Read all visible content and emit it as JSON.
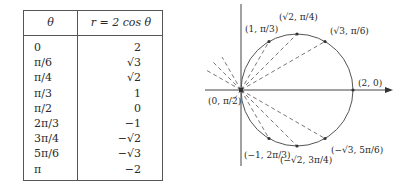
{
  "table": {
    "headers": {
      "theta": "θ",
      "r": "r = 2 cos θ"
    },
    "rows": [
      {
        "theta": "0",
        "r": "2"
      },
      {
        "theta": "π/6",
        "r": "√3"
      },
      {
        "theta": "π/4",
        "r": "√2"
      },
      {
        "theta": "π/3",
        "r": "1"
      },
      {
        "theta": "π/2",
        "r": "0"
      },
      {
        "theta": "2π/3",
        "r": "−1"
      },
      {
        "theta": "3π/4",
        "r": "−√2"
      },
      {
        "theta": "5π/6",
        "r": "−√3"
      },
      {
        "theta": "π",
        "r": "−2"
      }
    ]
  },
  "graph": {
    "curve": "r = 2 cos θ (circle)",
    "points": [
      {
        "label": "(1, π/3)",
        "name": "point-1-pi-3"
      },
      {
        "label": "(√2, π/4)",
        "name": "point-sqrt2-pi-4"
      },
      {
        "label": "(√3, π/6)",
        "name": "point-sqrt3-pi-6"
      },
      {
        "label": "(2, 0)",
        "name": "point-2-0"
      },
      {
        "label": "(0, π/2)",
        "name": "point-0-pi-2"
      },
      {
        "label": "(−1, 2π/3)",
        "name": "point-neg1-2pi-3"
      },
      {
        "label": "(−√2, 3π/4)",
        "name": "point-negsqrt2-3pi-4"
      },
      {
        "label": "(−√3, 5π/6)",
        "name": "point-negsqrt3-5pi-6"
      }
    ]
  }
}
